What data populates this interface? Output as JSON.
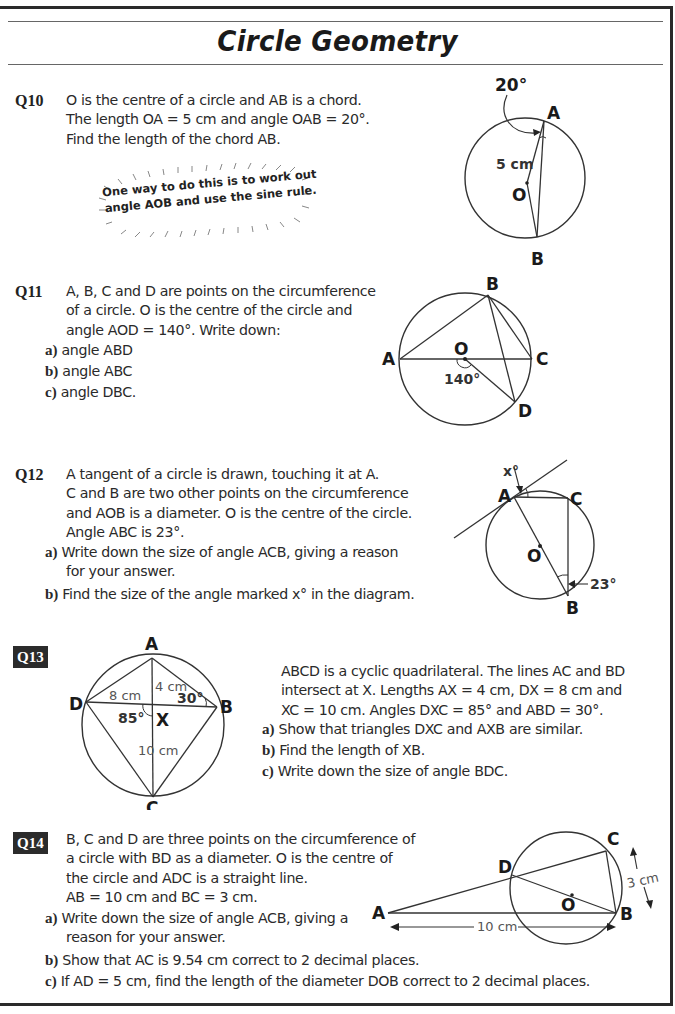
{
  "title": "Circle Geometry",
  "questions": [
    {
      "id": "Q10",
      "number_style": "plain",
      "text_lines": [
        "O is the centre of a circle and AB is a chord.",
        "The length OA = 5 cm and angle OAB = 20°.",
        "Find the length of the chord AB."
      ],
      "hint_lines": [
        "One way to do this is to work out",
        "angle AOB and use the sine rule."
      ],
      "diagram": {
        "labels": {
          "angle": "20°",
          "A": "A",
          "B": "B",
          "O": "O",
          "OA": "5 cm"
        }
      }
    },
    {
      "id": "Q11",
      "number_style": "plain",
      "text_lines": [
        "A, B, C and D are points on the circumference",
        "of a circle.  O is the centre of the circle and",
        "angle AOD = 140°.  Write down:"
      ],
      "parts": [
        {
          "label": "a)",
          "text": "angle ABD"
        },
        {
          "label": "b)",
          "text": "angle ABC"
        },
        {
          "label": "c)",
          "text": "angle DBC."
        }
      ],
      "diagram": {
        "labels": {
          "A": "A",
          "B": "B",
          "C": "C",
          "D": "D",
          "O": "O",
          "angle": "140°"
        }
      }
    },
    {
      "id": "Q12",
      "number_style": "plain",
      "text_lines": [
        "A tangent of a circle is drawn, touching it at A.",
        "C and B are two other points on the circumference",
        "and AOB is a diameter.  O is the centre of the circle.",
        "Angle ABC is 23°."
      ],
      "parts": [
        {
          "label": "a)",
          "text_lines": [
            "Write down the size of angle ACB, giving a reason",
            "for your answer."
          ]
        },
        {
          "label": "b)",
          "text_lines": [
            "Find the size of the angle marked x° in the diagram."
          ]
        }
      ],
      "diagram": {
        "labels": {
          "x": "x°",
          "A": "A",
          "B": "B",
          "C": "C",
          "O": "O",
          "angle": "23°"
        }
      }
    },
    {
      "id": "Q13",
      "number_style": "badge",
      "text_lines": [
        "ABCD is a cyclic quadrilateral.  The lines AC and BD",
        "intersect at X.  Lengths AX = 4 cm, DX = 8 cm and",
        "XC = 10 cm.  Angles DXC = 85° and ABD = 30°."
      ],
      "parts": [
        {
          "label": "a)",
          "text": "Show that triangles DXC and AXB are similar."
        },
        {
          "label": "b)",
          "text": "Find the length of XB."
        },
        {
          "label": "c)",
          "text": "Write down the size of angle BDC."
        }
      ],
      "diagram": {
        "labels": {
          "A": "A",
          "B": "B",
          "C": "C",
          "D": "D",
          "X": "X",
          "AX": "4 cm",
          "DX": "8 cm",
          "XC": "10 cm",
          "angle_dxc": "85°",
          "angle_abd": "30°"
        }
      }
    },
    {
      "id": "Q14",
      "number_style": "badge",
      "text_lines": [
        "B, C and D are three points on the circumference of",
        "a circle with BD as a diameter.  O is the centre of",
        "the circle and ADC is a straight line.",
        "AB = 10 cm and BC = 3 cm."
      ],
      "parts": [
        {
          "label": "a)",
          "text_lines": [
            "Write down the size of angle ACB, giving a",
            "reason for your answer."
          ]
        },
        {
          "label": "b)",
          "text_lines": [
            "Show that AC is 9.54 cm correct to 2 decimal places."
          ]
        },
        {
          "label": "c)",
          "text_lines": [
            "If AD = 5 cm, find the length of the diameter DOB correct to 2 decimal places."
          ]
        }
      ],
      "diagram": {
        "labels": {
          "A": "A",
          "B": "B",
          "C": "C",
          "D": "D",
          "O": "O",
          "AB": "10 cm",
          "BC": "3 cm"
        }
      }
    }
  ]
}
